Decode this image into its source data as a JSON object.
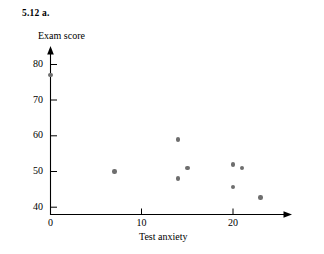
{
  "exercise": {
    "label": "5.12  a."
  },
  "chart_data": {
    "type": "scatter",
    "title": "",
    "xlabel": "Test anxiety",
    "ylabel": "Exam score",
    "xlim": [
      0,
      26
    ],
    "ylim": [
      38,
      82
    ],
    "xticks": [
      0,
      10,
      20
    ],
    "xtick_labels": [
      "0",
      "10",
      "20"
    ],
    "yticks": [
      40,
      50,
      60,
      70,
      80
    ],
    "ytick_labels": [
      "40",
      "50",
      "60",
      "70",
      "80"
    ],
    "grid": false,
    "legend": null,
    "point_color": "#6e6e6e",
    "axis_color": "#000000",
    "points": [
      {
        "x": 0,
        "y": 77
      },
      {
        "x": 7,
        "y": 50
      },
      {
        "x": 14,
        "y": 59
      },
      {
        "x": 14,
        "y": 48
      },
      {
        "x": 15,
        "y": 51
      },
      {
        "x": 20,
        "y": 52
      },
      {
        "x": 20,
        "y": 45.7
      },
      {
        "x": 21,
        "y": 51
      },
      {
        "x": 23,
        "y": 42.7
      }
    ]
  },
  "axes": {
    "y_title": "Exam score",
    "x_title": "Test anxiety"
  }
}
